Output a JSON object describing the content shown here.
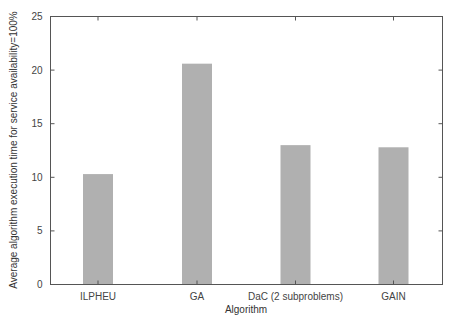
{
  "chart_data": {
    "type": "bar",
    "title": "",
    "xlabel": "Algorithm",
    "ylabel": "Average algorithm execution time for service availability=100%",
    "categories": [
      "ILPHEU",
      "GA",
      "DaC (2 subproblems)",
      "GAIN"
    ],
    "values": [
      10.3,
      20.6,
      13.0,
      12.8
    ],
    "ylim": [
      0,
      25
    ],
    "yticks": [
      0,
      5,
      10,
      15,
      20,
      25
    ],
    "grid": false,
    "legend": null,
    "bar_color": "#b0b0b0",
    "axis_color": "#555555"
  }
}
